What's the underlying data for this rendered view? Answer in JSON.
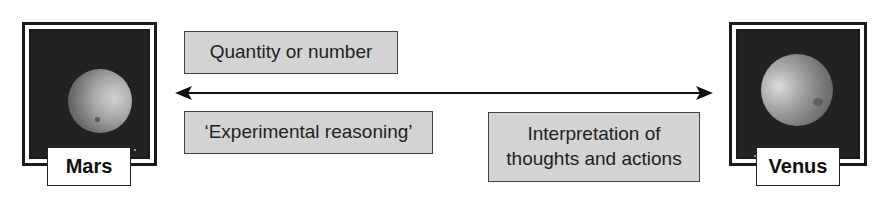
{
  "left_planet": {
    "name": "Mars",
    "image": "mars-planet-photo"
  },
  "right_planet": {
    "name": "Venus",
    "image": "venus-planet-photo"
  },
  "arrow": {
    "type": "double-headed-arrow",
    "direction": "left-right"
  },
  "concepts_top": [
    {
      "text": "Quantity or number"
    }
  ],
  "concepts_bottom": [
    {
      "text": "‘Experimental reasoning’"
    },
    {
      "text_line1": "Interpretation of",
      "text_line2": "thoughts and actions"
    }
  ],
  "colors": {
    "box_fill": "#d3d3d3",
    "frame": "#1a1a1a",
    "space": "#222222"
  }
}
